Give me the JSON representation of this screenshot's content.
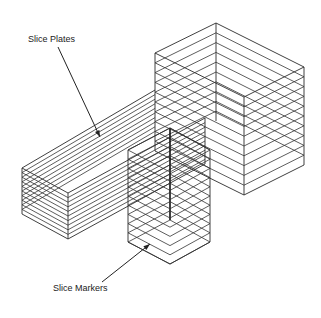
{
  "diagram": {
    "labels": {
      "slice_plates": "Slice Plates",
      "slice_markers": "Slice Markers"
    },
    "colors": {
      "background": "#ffffff",
      "lines": "#2a2a2a"
    },
    "slice_count": 9
  }
}
